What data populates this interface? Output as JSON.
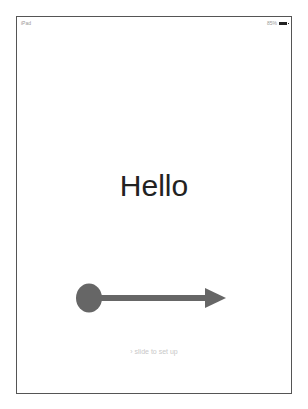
{
  "status_bar": {
    "carrier": "iPad",
    "battery_percent": "85%"
  },
  "main": {
    "greeting": "Hello",
    "slide_hint": "slide to set up",
    "slide_chevron": "›"
  },
  "annotation": {
    "type": "arrow",
    "direction": "right",
    "color": "#666666"
  }
}
